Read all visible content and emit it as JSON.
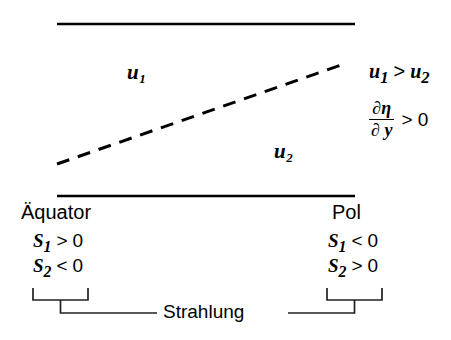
{
  "figure": {
    "upper_layer_label": "u",
    "upper_layer_sub": "1",
    "lower_layer_label": "u",
    "lower_layer_sub": "2",
    "inequality": {
      "lhs": "u",
      "lhs_sub": "1",
      "operator": ">",
      "rhs": "u",
      "rhs_sub": "2"
    },
    "derivative": {
      "numerator": "∂η",
      "denominator": "∂ y",
      "comparison": "> 0"
    },
    "left_boundary_label": "Äquator",
    "right_boundary_label": "Pol",
    "left_terms": [
      {
        "symbol": "S",
        "sub": "1",
        "relation": ">",
        "value": "0"
      },
      {
        "symbol": "S",
        "sub": "2",
        "relation": "<",
        "value": "0"
      }
    ],
    "right_terms": [
      {
        "symbol": "S",
        "sub": "1",
        "relation": "<",
        "value": "0"
      },
      {
        "symbol": "S",
        "sub": "2",
        "relation": ">",
        "value": "0"
      }
    ],
    "bottom_label": "Strahlung",
    "colors": {
      "stroke": "#000000",
      "background": "#ffffff",
      "bracket_stroke": "#231f20"
    },
    "geometry": {
      "top_line": {
        "x1": 57,
        "y1": 24,
        "x2": 355,
        "y2": 24,
        "width": 2.6
      },
      "bottom_line": {
        "x1": 57,
        "y1": 196,
        "x2": 355,
        "y2": 196,
        "width": 2.6
      },
      "interface_line": {
        "x1": 57,
        "y1": 164,
        "x2": 347,
        "y2": 63,
        "width": 3,
        "style": "dashed",
        "dash": "13 9"
      },
      "left_bracket": {
        "x_start": 33,
        "x_end": 88,
        "y_top": 288,
        "y_bottom": 300,
        "stem_x": 60,
        "stem_y": 313
      },
      "right_bracket": {
        "x_start": 327,
        "x_end": 382,
        "y_top": 288,
        "y_bottom": 300,
        "stem_x": 355,
        "stem_y": 313
      },
      "baseline_left": {
        "x1": 60,
        "y1": 313,
        "x2": 157,
        "y2": 313
      },
      "baseline_right": {
        "x1": 288,
        "y1": 313,
        "x2": 355,
        "y2": 313
      }
    }
  }
}
